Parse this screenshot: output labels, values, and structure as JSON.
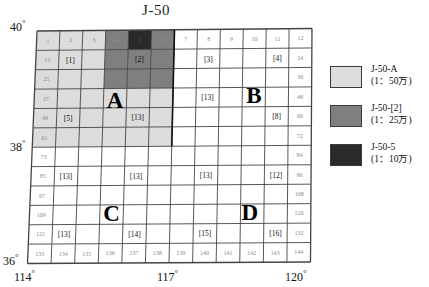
{
  "title": "J-50",
  "axes": {
    "left": [
      {
        "label": "40",
        "deg": "°"
      },
      {
        "label": "38",
        "deg": "°"
      },
      {
        "label": "36",
        "deg": "°"
      }
    ],
    "bottom": [
      {
        "label": "114",
        "deg": "°"
      },
      {
        "label": "117",
        "deg": "°"
      },
      {
        "label": "120",
        "deg": "°"
      }
    ],
    "lat_top": "40°",
    "lat_mid": "38°",
    "lat_bottom": "36°",
    "lon_left": "114°",
    "lon_mid": "117°",
    "lon_right": "120°"
  },
  "grid": {
    "rows": 12,
    "cols": 12,
    "numbers": [
      [
        1,
        2,
        3,
        4,
        5,
        6,
        7,
        8,
        9,
        10,
        11,
        12
      ],
      [
        13,
        14,
        15,
        16,
        17,
        18,
        19,
        20,
        21,
        22,
        23,
        24
      ],
      [
        25,
        26,
        27,
        28,
        29,
        30,
        31,
        32,
        33,
        34,
        35,
        36
      ],
      [
        37,
        38,
        39,
        40,
        41,
        42,
        43,
        44,
        45,
        46,
        47,
        48
      ],
      [
        49,
        50,
        51,
        52,
        53,
        54,
        55,
        56,
        57,
        58,
        59,
        60
      ],
      [
        61,
        62,
        63,
        64,
        65,
        66,
        67,
        68,
        69,
        70,
        71,
        72
      ],
      [
        73,
        74,
        75,
        76,
        77,
        78,
        79,
        80,
        81,
        82,
        83,
        84
      ],
      [
        85,
        86,
        87,
        88,
        89,
        90,
        91,
        92,
        93,
        94,
        95,
        96
      ],
      [
        97,
        98,
        99,
        100,
        101,
        102,
        103,
        104,
        105,
        106,
        107,
        108
      ],
      [
        109,
        110,
        111,
        112,
        113,
        114,
        115,
        116,
        117,
        118,
        119,
        120
      ],
      [
        121,
        122,
        123,
        124,
        125,
        126,
        127,
        128,
        129,
        130,
        131,
        132
      ],
      [
        133,
        134,
        135,
        136,
        137,
        138,
        139,
        140,
        141,
        142,
        143,
        144
      ]
    ],
    "visible_numbers": {
      "row_first": [
        1,
        2,
        3,
        4,
        5,
        6,
        7,
        8,
        9,
        10,
        11,
        12
      ],
      "row_last": [
        133,
        134,
        135,
        136,
        137,
        138,
        139,
        140,
        141,
        142,
        143,
        144
      ],
      "col_first": [
        1,
        13,
        25,
        37,
        49,
        61,
        73,
        85,
        97,
        109,
        121,
        133
      ],
      "col_last": [
        12,
        24,
        36,
        48,
        60,
        72,
        84,
        96,
        108,
        120,
        132,
        144
      ]
    },
    "shading": {
      "light_cells": [
        1,
        2,
        3,
        13,
        14,
        15,
        25,
        26,
        27,
        37,
        38,
        39,
        40,
        41,
        42,
        49,
        50,
        51,
        52,
        53,
        54,
        61,
        62,
        63,
        64,
        65,
        66
      ],
      "medium_cells": [
        4,
        6,
        16,
        17,
        18,
        28,
        29,
        30
      ],
      "dark_cells": [
        5
      ]
    },
    "codes": [
      {
        "text": "[1]",
        "row": 2,
        "col": 2
      },
      {
        "text": "[2]",
        "row": 2,
        "col": 5
      },
      {
        "text": "[3]",
        "row": 2,
        "col": 8
      },
      {
        "text": "[4]",
        "row": 2,
        "col": 11
      },
      {
        "text": "[5]",
        "row": 5,
        "col": 2
      },
      {
        "text": "[13]",
        "row": 5,
        "col": 5
      },
      {
        "text": "[13]",
        "row": 4,
        "col": 8
      },
      {
        "text": "[8]",
        "row": 5,
        "col": 11
      },
      {
        "text": "[13]",
        "row": 8,
        "col": 2
      },
      {
        "text": "[13]",
        "row": 8,
        "col": 5
      },
      {
        "text": "[13]",
        "row": 8,
        "col": 8
      },
      {
        "text": "[12]",
        "row": 8,
        "col": 11
      },
      {
        "text": "[13]",
        "row": 11,
        "col": 2
      },
      {
        "text": "[14]",
        "row": 11,
        "col": 5
      },
      {
        "text": "[15]",
        "row": 11,
        "col": 8
      },
      {
        "text": "[16]",
        "row": 11,
        "col": 11
      }
    ],
    "region_letters": [
      {
        "text": "A",
        "row": 3.6,
        "col": 3.5
      },
      {
        "text": "B",
        "row": 3.4,
        "col": 9.5
      },
      {
        "text": "C",
        "row": 9.4,
        "col": 3.5
      },
      {
        "text": "D",
        "row": 9.4,
        "col": 9.4
      }
    ]
  },
  "legend": {
    "items": [
      {
        "name": "J-50-A",
        "scale": "(1：50万)",
        "color": "#dcdcdc",
        "swatch": "light-swatch"
      },
      {
        "name": "J-50-[2]",
        "scale": "(1：25万)",
        "color": "#7f7f7f",
        "swatch": "medium-swatch"
      },
      {
        "name": "J-50-5",
        "scale": "(1：10万)",
        "color": "#2a2a2a",
        "swatch": "dark-swatch"
      }
    ]
  },
  "colors": {
    "light": "#dcdcdc",
    "medium": "#7f7f7f",
    "dark": "#2a2a2a",
    "white": "#ffffff",
    "grid_line": "#444444",
    "border": "#222222",
    "number_text": "#8a8a8a"
  }
}
